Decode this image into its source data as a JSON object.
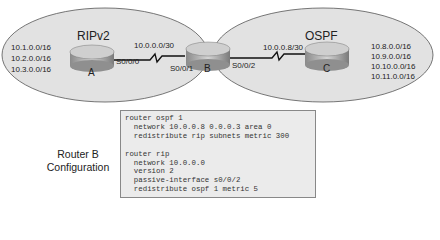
{
  "areas": [
    {
      "name": "RIPv2",
      "routers": [
        "A"
      ]
    },
    {
      "name": "OSPF",
      "routers": [
        "C"
      ]
    }
  ],
  "routers": {
    "A": {
      "label": "A",
      "networks": [
        "10.1.0.0/16",
        "10.2.0.0/16",
        "10.3.0.0/16"
      ],
      "interface": "S0/0/0"
    },
    "B": {
      "label": "B",
      "interfaces": [
        "S0/0/1",
        "S0/0/2"
      ]
    },
    "C": {
      "label": "C",
      "networks": [
        "10.8.0.0/16",
        "10.9.0.0/16",
        "10.10.0.0/16",
        "10.11.0.0/16"
      ]
    }
  },
  "links": [
    {
      "from": "A",
      "to": "B",
      "subnet": "10.0.0.0/30"
    },
    {
      "from": "B",
      "to": "C",
      "subnet": "10.0.0.8/30"
    }
  ],
  "config": {
    "title_line1": "Router B",
    "title_line2": "Configuration",
    "text": "router ospf 1\n  network 10.0.0.8 0.0.0.3 area 0\n  redistribute rip subnets metric 300\n\nrouter rip\n  network 10.0.0.0\n  version 2\n  passive-interface s0/0/2\n  redistribute ospf 1 metric 5"
  }
}
